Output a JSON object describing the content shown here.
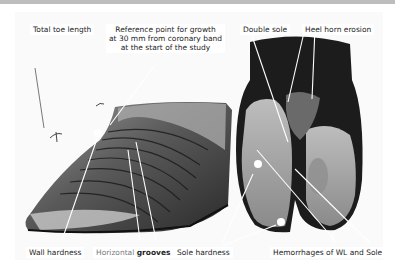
{
  "figure": {
    "top_labels": {
      "total_toe_length": "Total toe length",
      "reference_point": {
        "line1": "Reference point for growth",
        "line2": "at 30 mm from coronary band",
        "line3": "at the start of the study"
      },
      "double_sole": "Double sole",
      "heel_horn_erosion": "Heel horn erosion"
    },
    "bottom_labels": {
      "wall_hardness": "Wall hardness",
      "horizontal_grooves": {
        "part1": "Horizontal",
        "part2": "grooves"
      },
      "sole_hardness": "Sole hardness",
      "hemorrhages": "Hemorrhages of WL and Sole"
    },
    "colors": {
      "frame": "#bdbdbd",
      "background": "#ffffff",
      "hoof_dark": "#1a1a1a",
      "hoof_mid": "#6e6e6e",
      "hoof_light": "#b5b5b5",
      "annotation_line": "#ffffff",
      "marker_dot": "#ffffff"
    }
  }
}
